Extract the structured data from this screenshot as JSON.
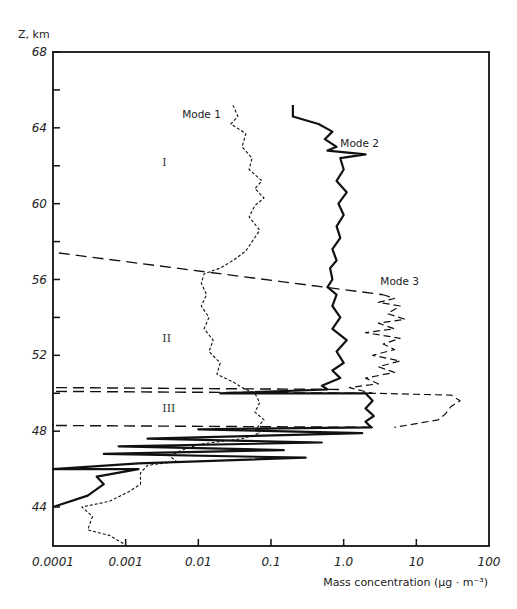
{
  "chart_data": {
    "type": "line",
    "title": "",
    "ylabel": "Z, km",
    "xlabel": "Mass concentration (μg · m⁻³)",
    "xscale": "log",
    "xlim": [
      0.0001,
      100
    ],
    "ylim": [
      42,
      68
    ],
    "x_ticks": [
      "0.0001",
      "0.001",
      "0.01",
      "0.1",
      "1.0",
      "10",
      "100"
    ],
    "y_ticks": [
      "44",
      "48",
      "52",
      "56",
      "60",
      "64",
      "68"
    ],
    "grid": false,
    "legend": "inline labels",
    "annotations": [
      {
        "text": "Mode 1",
        "x": 0.006,
        "y": 64.5
      },
      {
        "text": "Mode 2",
        "x": 0.9,
        "y": 63.0
      },
      {
        "text": "Mode 3",
        "x": 3.2,
        "y": 55.7
      },
      {
        "text": "I",
        "x": 0.0032,
        "y": 62.0
      },
      {
        "text": "II",
        "x": 0.0032,
        "y": 52.7
      },
      {
        "text": "III",
        "x": 0.0032,
        "y": 49.0
      }
    ],
    "region_boundaries": [
      {
        "name": "I/II upper boundary",
        "points": [
          [
            0.00012,
            57.4
          ],
          [
            3.5,
            55.2
          ]
        ]
      },
      {
        "name": "II/III boundary a",
        "points": [
          [
            0.00011,
            50.3
          ],
          [
            1.0,
            50.2
          ]
        ]
      },
      {
        "name": "II/III boundary b",
        "points": [
          [
            0.00011,
            50.1
          ],
          [
            2.5,
            50.0
          ]
        ]
      },
      {
        "name": "III lower boundary",
        "points": [
          [
            0.00011,
            48.3
          ],
          [
            3.0,
            48.2
          ]
        ]
      }
    ],
    "series": [
      {
        "name": "Mode 1",
        "style": "dotted",
        "points": [
          [
            0.03,
            65.2
          ],
          [
            0.035,
            64.6
          ],
          [
            0.028,
            64.2
          ],
          [
            0.045,
            63.7
          ],
          [
            0.04,
            63.0
          ],
          [
            0.055,
            62.4
          ],
          [
            0.05,
            61.8
          ],
          [
            0.075,
            61.2
          ],
          [
            0.06,
            60.8
          ],
          [
            0.08,
            60.3
          ],
          [
            0.06,
            59.9
          ],
          [
            0.05,
            59.3
          ],
          [
            0.07,
            58.6
          ],
          [
            0.055,
            58.0
          ],
          [
            0.045,
            57.5
          ],
          [
            0.03,
            57.0
          ],
          [
            0.02,
            56.6
          ],
          [
            0.012,
            56.3
          ],
          [
            0.011,
            55.8
          ],
          [
            0.013,
            55.2
          ],
          [
            0.011,
            54.6
          ],
          [
            0.014,
            54.0
          ],
          [
            0.012,
            53.4
          ],
          [
            0.016,
            52.8
          ],
          [
            0.014,
            52.2
          ],
          [
            0.02,
            51.6
          ],
          [
            0.018,
            51.0
          ],
          [
            0.03,
            50.6
          ],
          [
            0.04,
            50.3
          ],
          [
            0.06,
            50.0
          ],
          [
            0.07,
            49.5
          ],
          [
            0.06,
            49.0
          ],
          [
            0.08,
            48.6
          ],
          [
            0.065,
            48.2
          ],
          [
            0.07,
            47.9
          ],
          [
            0.04,
            47.6
          ],
          [
            0.01,
            47.3
          ],
          [
            0.006,
            47.0
          ],
          [
            0.004,
            46.7
          ],
          [
            0.005,
            46.4
          ],
          [
            0.002,
            46.2
          ],
          [
            0.0016,
            45.8
          ],
          [
            0.0016,
            45.2
          ],
          [
            0.0011,
            44.8
          ],
          [
            0.0006,
            44.3
          ],
          [
            0.00025,
            44.0
          ],
          [
            0.00035,
            43.5
          ],
          [
            0.0003,
            42.8
          ],
          [
            0.0006,
            42.5
          ],
          [
            0.001,
            42.0
          ]
        ]
      },
      {
        "name": "Mode 2",
        "style": "solid-thick",
        "points": [
          [
            0.2,
            65.2
          ],
          [
            0.2,
            64.6
          ],
          [
            0.45,
            64.2
          ],
          [
            0.7,
            63.8
          ],
          [
            0.55,
            63.4
          ],
          [
            0.8,
            63.0
          ],
          [
            0.6,
            62.8
          ],
          [
            2.0,
            62.6
          ],
          [
            0.9,
            62.4
          ],
          [
            1.0,
            61.8
          ],
          [
            0.8,
            61.2
          ],
          [
            1.1,
            60.6
          ],
          [
            0.85,
            60.0
          ],
          [
            1.0,
            59.4
          ],
          [
            0.8,
            58.8
          ],
          [
            0.9,
            58.2
          ],
          [
            0.7,
            57.6
          ],
          [
            0.8,
            57.0
          ],
          [
            0.65,
            56.6
          ],
          [
            0.7,
            56.0
          ],
          [
            0.6,
            55.6
          ],
          [
            0.8,
            55.2
          ],
          [
            0.7,
            54.6
          ],
          [
            0.9,
            54.0
          ],
          [
            0.7,
            53.4
          ],
          [
            1.1,
            52.8
          ],
          [
            0.8,
            52.2
          ],
          [
            1.0,
            51.6
          ],
          [
            0.7,
            51.2
          ],
          [
            0.9,
            50.8
          ],
          [
            0.5,
            50.4
          ],
          [
            0.6,
            50.2
          ],
          [
            0.02,
            50.0
          ],
          [
            2.0,
            50.0
          ],
          [
            2.5,
            49.6
          ],
          [
            2.0,
            49.2
          ],
          [
            2.6,
            48.8
          ],
          [
            2.0,
            48.5
          ],
          [
            2.4,
            48.2
          ],
          [
            0.01,
            48.1
          ],
          [
            1.8,
            47.9
          ],
          [
            0.002,
            47.6
          ],
          [
            0.5,
            47.4
          ],
          [
            0.0008,
            47.2
          ],
          [
            0.15,
            47.0
          ],
          [
            0.0005,
            46.8
          ],
          [
            0.3,
            46.6
          ],
          [
            0.0015,
            46.3
          ],
          [
            0.0001,
            46.0
          ],
          [
            0.0015,
            46.0
          ],
          [
            0.0004,
            45.6
          ],
          [
            0.0005,
            45.2
          ],
          [
            0.0003,
            44.6
          ],
          [
            0.0001,
            44.0
          ]
        ]
      },
      {
        "name": "Mode 3",
        "style": "dashed",
        "points": [
          [
            3.5,
            55.2
          ],
          [
            5.0,
            55.0
          ],
          [
            3.0,
            54.8
          ],
          [
            6.0,
            54.6
          ],
          [
            4.0,
            54.2
          ],
          [
            7.0,
            53.9
          ],
          [
            3.0,
            53.7
          ],
          [
            5.0,
            53.4
          ],
          [
            2.0,
            53.2
          ],
          [
            6.0,
            52.9
          ],
          [
            3.5,
            52.6
          ],
          [
            5.0,
            52.3
          ],
          [
            2.5,
            52.0
          ],
          [
            6.0,
            51.7
          ],
          [
            3.0,
            51.4
          ],
          [
            5.0,
            51.1
          ],
          [
            2.0,
            50.8
          ],
          [
            3.0,
            50.5
          ],
          [
            1.2,
            50.3
          ],
          [
            2.5,
            50.0
          ],
          [
            30.0,
            49.9
          ],
          [
            40.0,
            49.6
          ],
          [
            30.0,
            49.3
          ],
          [
            25.0,
            48.9
          ],
          [
            20.0,
            48.6
          ],
          [
            10.0,
            48.4
          ],
          [
            5.0,
            48.2
          ]
        ]
      }
    ]
  },
  "axes": {
    "y_title": "Z, km",
    "x_title": "Mass concentration (μg · m⁻³)"
  }
}
